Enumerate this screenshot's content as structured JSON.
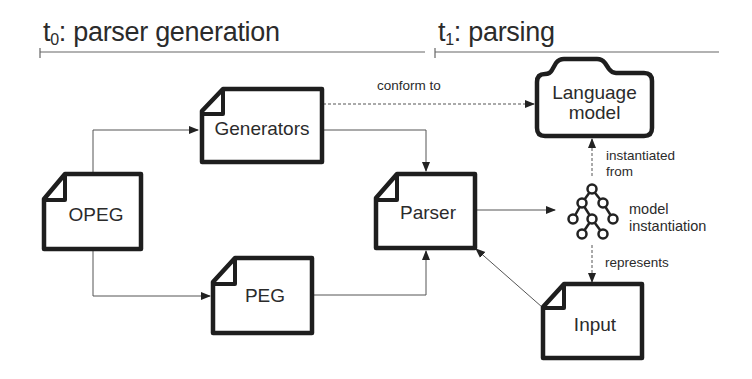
{
  "phases": [
    {
      "id": "t0",
      "prefix": "t",
      "subscript": "0",
      "label": ": parser generation"
    },
    {
      "id": "t1",
      "prefix": "t",
      "subscript": "1",
      "label": ": parsing"
    }
  ],
  "nodes": {
    "generators": {
      "label": "Generators",
      "shape": "document"
    },
    "opeg": {
      "label": "OPEG",
      "shape": "document"
    },
    "peg": {
      "label": "PEG",
      "shape": "document"
    },
    "parser": {
      "label": "Parser",
      "shape": "document"
    },
    "language_model": {
      "line1": "Language",
      "line2": "model",
      "shape": "folder"
    },
    "model_instantiation": {
      "line1": "model",
      "line2": "instantiation",
      "shape": "tree-icon"
    },
    "input": {
      "label": "Input",
      "shape": "document"
    }
  },
  "edges": {
    "conform_to": {
      "label": "conform to",
      "from": "Generators",
      "to": "Language model",
      "style": "dashed"
    },
    "instantiated_from": {
      "line1": "instantiated",
      "line2": "from",
      "from": "model instantiation",
      "to": "Language model",
      "style": "dashed"
    },
    "represents": {
      "label": "represents",
      "from": "model instantiation",
      "to": "Input",
      "style": "dashed"
    },
    "opeg_to_generators": {
      "from": "OPEG",
      "to": "Generators",
      "style": "solid"
    },
    "opeg_to_peg": {
      "from": "OPEG",
      "to": "PEG",
      "style": "solid"
    },
    "generators_to_parser": {
      "from": "Generators",
      "to": "Parser",
      "style": "solid"
    },
    "peg_to_parser": {
      "from": "PEG",
      "to": "Parser",
      "style": "solid"
    },
    "parser_to_instantiation": {
      "from": "Parser",
      "to": "model instantiation",
      "style": "solid"
    },
    "input_to_parser": {
      "from": "Input",
      "to": "Parser",
      "style": "solid"
    }
  },
  "colors": {
    "stroke": "#1e1e1e",
    "line": "#555555",
    "text": "#2b2b2b",
    "background": "#ffffff"
  }
}
